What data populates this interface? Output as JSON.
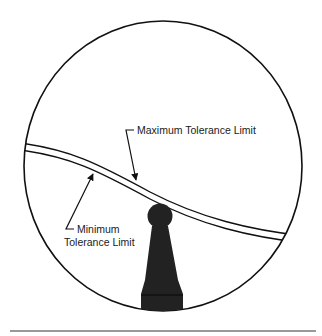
{
  "diagram": {
    "labels": {
      "maximum": "Maximum Tolerance Limit",
      "minimum_line1": "Minimum",
      "minimum_line2": "Tolerance Limit"
    },
    "icons": {
      "pawn": "pawn-icon",
      "circle": "circle-outline"
    },
    "colors": {
      "stroke": "#111111",
      "pawn_fill": "#222222",
      "rule": "#777777",
      "background": "#ffffff"
    }
  }
}
